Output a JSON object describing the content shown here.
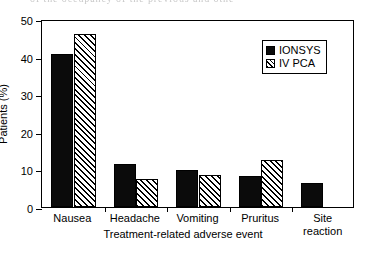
{
  "page_artifact": {
    "clipped_text_line": "of the occupancy of the previous and othe"
  },
  "chart_data": {
    "type": "bar",
    "title": "",
    "subtitle": "",
    "xlabel": "Treatment-related adverse event",
    "ylabel": "Patients (%)",
    "categories": [
      "Nausea",
      "Headache",
      "Vomiting",
      "Pruritus",
      "Site\nreaction"
    ],
    "category_labels_flat": [
      "Nausea",
      "Headache",
      "Vomiting",
      "Pruritus",
      "Site reaction"
    ],
    "series": [
      {
        "name": "IONSYS",
        "fill": "solid-black",
        "color": "#0b0b0b",
        "values": [
          40.8,
          11.5,
          9.9,
          8.3,
          6.4
        ]
      },
      {
        "name": "IV PCA",
        "fill": "diagonal-hatch",
        "color": "#000000",
        "values": [
          46.1,
          7.5,
          8.6,
          12.6,
          null
        ]
      }
    ],
    "ylim": [
      0,
      50
    ],
    "yticks": [
      0,
      10,
      20,
      30,
      40,
      50
    ],
    "ytick_labels": [
      "0",
      "10",
      "20",
      "30",
      "40",
      "50"
    ],
    "grid": false,
    "legend": {
      "position": "top-right",
      "entries": [
        "IONSYS",
        "IV PCA"
      ],
      "bordered": true
    },
    "axis_frame": "box"
  }
}
